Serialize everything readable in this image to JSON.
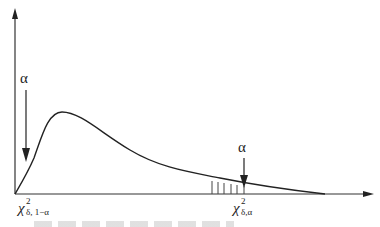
{
  "figure": {
    "type": "probability-density-diagram",
    "colors": {
      "stroke": "#222222",
      "background": "#ffffff",
      "hatch": "#444444"
    },
    "axes": {
      "y_axis_arrow": true,
      "x_axis_arrow": true
    },
    "left_marker": {
      "symbol": "α",
      "label_main": "χ",
      "label_sup": "2",
      "label_sub": "δ, 1−α"
    },
    "right_marker": {
      "symbol": "α",
      "label_main": "χ",
      "label_sup": "2",
      "label_sub": "δ,α"
    },
    "hatched_region": {
      "lines": 6,
      "position": "left of right critical value"
    }
  }
}
